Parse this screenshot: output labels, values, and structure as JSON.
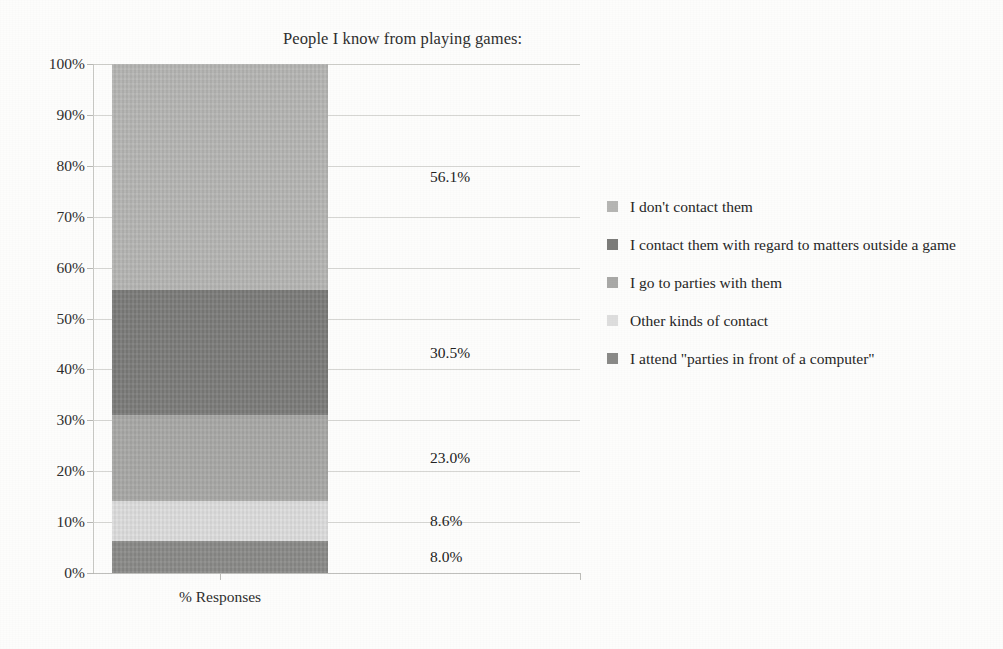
{
  "chart_data": {
    "type": "bar",
    "subtype": "stacked-bar-single-category",
    "title": "People I know from playing games:",
    "xlabel": "% Responses",
    "ylabel": "",
    "categories": [
      "% Responses"
    ],
    "ylim": [
      0,
      100
    ],
    "ytick_labels": [
      "100%",
      "90%",
      "80%",
      "70%",
      "60%",
      "50%",
      "40%",
      "30%",
      "20%",
      "10%",
      "0%"
    ],
    "ytick_values": [
      100,
      90,
      80,
      70,
      60,
      50,
      40,
      30,
      20,
      10,
      0
    ],
    "grid": true,
    "legend_position": "right",
    "stack_order_bottom_to_top": [
      "I attend \"parties in front of a computer\"",
      "Other kinds of contact",
      "I go to parties with them",
      "I contact them with regard to matters outside a game",
      "I don't contact them"
    ],
    "series": [
      {
        "name": "I don't contact them",
        "values": [
          56.1
        ],
        "label": "56.1%",
        "color": "#b6b6b4",
        "stack_from": 43.9,
        "stack_to": 100.0
      },
      {
        "name": "I contact them with regard to matters outside a game",
        "values": [
          30.5
        ],
        "label": "30.5%",
        "color": "#7c7c7a",
        "stack_from": 13.4,
        "stack_to": 43.9
      },
      {
        "name": "I go to parties with them",
        "values": [
          23.0
        ],
        "label": "23.0%",
        "color": "#a9a9a7",
        "stack_from": -9.6,
        "stack_to": 13.4
      },
      {
        "name": "Other kinds of contact",
        "values": [
          8.6
        ],
        "label": "8.6%",
        "color": "#dedede",
        "stack_from": 0,
        "stack_to": 0
      },
      {
        "name": "I attend \"parties in front of a computer\"",
        "values": [
          8.0
        ],
        "label": "8.0%",
        "color": "#8a8a88",
        "stack_from": 0,
        "stack_to": 0
      }
    ],
    "segments_rendered_bottom_to_top": [
      {
        "label": "8.0%",
        "value": 8.0,
        "color": "#8a8a88",
        "bottom_pct": 0.0,
        "top_pct": 6.2
      },
      {
        "label": "8.6%",
        "value": 8.6,
        "color": "#dedede",
        "bottom_pct": 6.2,
        "top_pct": 14.2
      },
      {
        "label": "23.0%",
        "value": 23.0,
        "color": "#a9a9a7",
        "bottom_pct": 14.2,
        "top_pct": 31.0
      },
      {
        "label": "30.5%",
        "value": 30.5,
        "color": "#7c7c7a",
        "bottom_pct": 31.0,
        "top_pct": 55.6
      },
      {
        "label": "56.1%",
        "value": 56.1,
        "color": "#b6b6b4",
        "bottom_pct": 55.6,
        "top_pct": 100.0
      }
    ],
    "data_labels": [
      {
        "text": "56.1%",
        "value": 56.1
      },
      {
        "text": "30.5%",
        "value": 30.5
      },
      {
        "text": "23.0%",
        "value": 23.0
      },
      {
        "text": "8.6%",
        "value": 8.6
      },
      {
        "text": "8.0%",
        "value": 8.0
      }
    ]
  },
  "legend": {
    "entries": [
      {
        "label": "I don't contact them",
        "color": "#b6b6b4"
      },
      {
        "label": "I contact them with regard to matters outside a game",
        "color": "#7c7c7a"
      },
      {
        "label": "I go to parties with them",
        "color": "#a9a9a7"
      },
      {
        "label": "Other kinds of contact",
        "color": "#dedede"
      },
      {
        "label": "I attend \"parties in front of a computer\"",
        "color": "#8a8a88"
      }
    ]
  },
  "axes": {
    "y_labels": [
      "100%",
      "90%",
      "80%",
      "70%",
      "60%",
      "50%",
      "40%",
      "30%",
      "20%",
      "10%",
      "0%"
    ],
    "x_label": "% Responses"
  }
}
